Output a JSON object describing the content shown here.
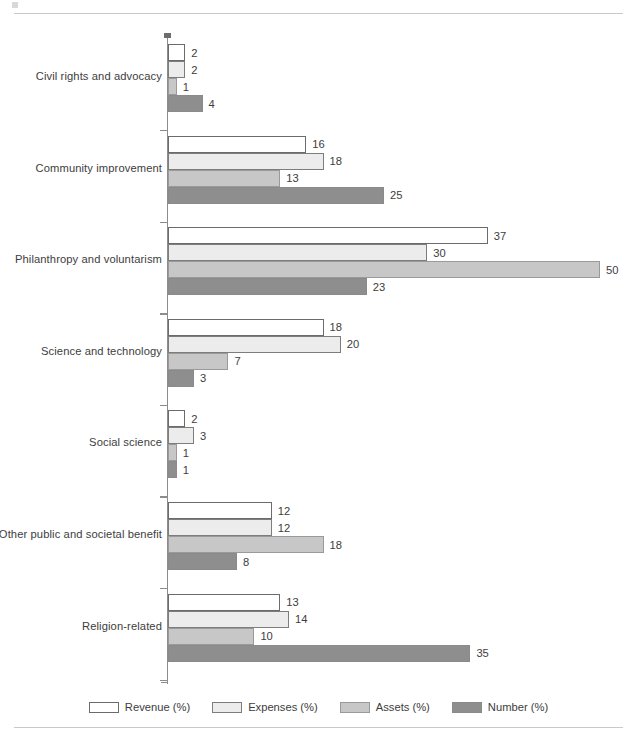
{
  "chart_data": {
    "type": "bar",
    "orientation": "horizontal",
    "title": "",
    "subtitle": "",
    "xlabel": "",
    "ylabel": "",
    "grid": false,
    "legend_position": "bottom",
    "xlim": [
      0,
      54
    ],
    "categories": [
      "Civil rights and advocacy",
      "Community improvement",
      "Philanthropy and voluntarism",
      "Science and technology",
      "Social science",
      "Other public and societal benefit",
      "Religion-related"
    ],
    "series": [
      {
        "name": "Revenue (%)",
        "color": "#ffffff",
        "values": [
          2,
          16,
          37,
          18,
          2,
          12,
          13
        ]
      },
      {
        "name": "Expenses (%)",
        "color": "#ececec",
        "values": [
          2,
          18,
          30,
          20,
          3,
          12,
          14
        ]
      },
      {
        "name": "Assets (%)",
        "color": "#c7c7c7",
        "values": [
          1,
          13,
          50,
          7,
          1,
          18,
          10
        ]
      },
      {
        "name": "Number (%)",
        "color": "#8e8e8e",
        "values": [
          4,
          25,
          23,
          3,
          1,
          8,
          35
        ]
      }
    ]
  },
  "legend": {
    "items": [
      {
        "label": "Revenue (%)"
      },
      {
        "label": "Expenses (%)"
      },
      {
        "label": "Assets (%)"
      },
      {
        "label": "Number (%)"
      }
    ]
  }
}
